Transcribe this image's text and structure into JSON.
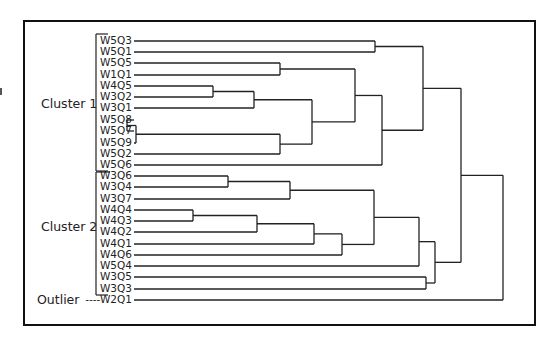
{
  "figure": {
    "type": "dendrogram",
    "orientation": "horizontal",
    "frame": {
      "left": 23,
      "top": 20,
      "right": 534,
      "bottom": 324
    },
    "line_color": "#222222",
    "groups": [
      {
        "label": "Cluster 1",
        "x": 41,
        "y": 96,
        "bracket": {
          "x": 96,
          "y1": 34,
          "y2": 171
        }
      },
      {
        "label": "Cluster 2",
        "x": 41,
        "y": 219,
        "bracket": {
          "x": 96,
          "y1": 172,
          "y2": 295
        }
      },
      {
        "label": "Outlier",
        "x": 37,
        "y": 292,
        "prefix": "----"
      }
    ],
    "leaf_line_start_x": 134,
    "leaves": [
      {
        "label": "W5Q3",
        "y": 41
      },
      {
        "label": "W5Q1",
        "y": 52
      },
      {
        "label": "W5Q5",
        "y": 63
      },
      {
        "label": "W1Q1",
        "y": 75
      },
      {
        "label": "W4Q5",
        "y": 86
      },
      {
        "label": "W3Q2",
        "y": 97
      },
      {
        "label": "W3Q1",
        "y": 108
      },
      {
        "label": "W5Q8",
        "y": 120
      },
      {
        "label": "W5Q7",
        "y": 131
      },
      {
        "label": "W5Q9",
        "y": 143
      },
      {
        "label": "W5Q2",
        "y": 154
      },
      {
        "label": "W5Q6",
        "y": 165
      },
      {
        "label": "W3Q6",
        "y": 176
      },
      {
        "label": "W3Q4",
        "y": 187
      },
      {
        "label": "W3Q7",
        "y": 199
      },
      {
        "label": "W4Q4",
        "y": 210
      },
      {
        "label": "W4Q3",
        "y": 221
      },
      {
        "label": "W4Q2",
        "y": 232
      },
      {
        "label": "W4Q1",
        "y": 244
      },
      {
        "label": "W4Q6",
        "y": 255
      },
      {
        "label": "W5Q4",
        "y": 266
      },
      {
        "label": "W3Q5",
        "y": 277
      },
      {
        "label": "W3Q3",
        "y": 289
      },
      {
        "label": "W2Q1",
        "y": 300
      }
    ],
    "merges": [
      {
        "id": "n1",
        "a": "W5Q3",
        "b": "W5Q1",
        "x": 375
      },
      {
        "id": "n2",
        "a": "W5Q5",
        "b": "W1Q1",
        "x": 280
      },
      {
        "id": "n3",
        "a": "W4Q5",
        "b": "W3Q2",
        "x": 213
      },
      {
        "id": "n4",
        "a": "n3",
        "b": "W3Q1",
        "x": 254
      },
      {
        "id": "n5",
        "a": "W5Q8",
        "b": "W5Q7",
        "x": 127
      },
      {
        "id": "n6",
        "a": "n5",
        "b": "W5Q9",
        "x": 136
      },
      {
        "id": "n7",
        "a": "n6",
        "b": "W5Q2",
        "x": 280
      },
      {
        "id": "n8",
        "a": "n4",
        "b": "n7",
        "x": 312
      },
      {
        "id": "n9",
        "a": "n2",
        "b": "n8",
        "x": 355
      },
      {
        "id": "n10",
        "a": "n9",
        "b": "W5Q6",
        "x": 382
      },
      {
        "id": "n11",
        "a": "n1",
        "b": "n10",
        "x": 423
      },
      {
        "id": "n12",
        "a": "W3Q6",
        "b": "W3Q4",
        "x": 228
      },
      {
        "id": "n13",
        "a": "n12",
        "b": "W3Q7",
        "x": 290
      },
      {
        "id": "n14",
        "a": "W4Q4",
        "b": "W4Q3",
        "x": 193
      },
      {
        "id": "n15",
        "a": "n14",
        "b": "W4Q2",
        "x": 257
      },
      {
        "id": "n16",
        "a": "n15",
        "b": "W4Q1",
        "x": 314
      },
      {
        "id": "n17",
        "a": "n16",
        "b": "W4Q6",
        "x": 342
      },
      {
        "id": "n18",
        "a": "n13",
        "b": "n17",
        "x": 374
      },
      {
        "id": "n19",
        "a": "n18",
        "b": "W5Q4",
        "x": 419
      },
      {
        "id": "n20",
        "a": "W3Q5",
        "b": "W3Q3",
        "x": 426
      },
      {
        "id": "n21",
        "a": "n19",
        "b": "n20",
        "x": 435
      },
      {
        "id": "n22",
        "a": "n11",
        "b": "n21",
        "x": 461
      },
      {
        "id": "n23",
        "a": "n22",
        "b": "W2Q1",
        "x": 503
      }
    ]
  }
}
